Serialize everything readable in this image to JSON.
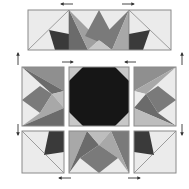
{
  "colors": {
    "background": "#ffffff",
    "white_fabric": "#ebebeb",
    "light_gray": "#bdbdbd",
    "mid_gray": "#8f8f8f",
    "dark_gray": "#6b6b6b",
    "charcoal": "#3a3a3a",
    "black": "#161616",
    "outline": "#8a8a8a"
  },
  "units": [
    {
      "id": "top-flying-geese",
      "row": 0,
      "position": "top"
    },
    {
      "id": "middle-left-unit",
      "row": 1,
      "position": "left"
    },
    {
      "id": "center-octagon-unit",
      "row": 1,
      "position": "center"
    },
    {
      "id": "middle-right-unit",
      "row": 1,
      "position": "right"
    },
    {
      "id": "bottom-left-corner",
      "row": 2,
      "position": "left"
    },
    {
      "id": "bottom-center-unit",
      "row": 2,
      "position": "center"
    },
    {
      "id": "bottom-right-corner",
      "row": 2,
      "position": "right"
    }
  ],
  "pressing_arrows": [
    {
      "id": "top-left",
      "direction": "left"
    },
    {
      "id": "top-right",
      "direction": "right"
    },
    {
      "id": "middle-left",
      "direction": "right"
    },
    {
      "id": "middle-right",
      "direction": "left"
    },
    {
      "id": "side-left-upper",
      "direction": "up"
    },
    {
      "id": "side-left-lower",
      "direction": "down"
    },
    {
      "id": "side-right-upper",
      "direction": "up"
    },
    {
      "id": "side-right-lower",
      "direction": "down"
    },
    {
      "id": "bottom-left",
      "direction": "left"
    },
    {
      "id": "bottom-right",
      "direction": "right"
    }
  ]
}
